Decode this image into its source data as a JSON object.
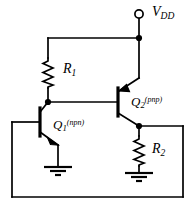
{
  "figure": {
    "type": "circuit-schematic",
    "title": "",
    "line_color": "#000000",
    "background_color": "#ffffff"
  },
  "labels": {
    "supply": {
      "symbol": "V",
      "subscript": "DD",
      "name": "supply-rail-label"
    },
    "r1": {
      "symbol": "R",
      "subscript": "1",
      "name": "resistor-r1-label"
    },
    "r2": {
      "symbol": "R",
      "subscript": "2",
      "name": "resistor-r2-label"
    },
    "q1": {
      "symbol": "Q",
      "subscript": "1",
      "superscript": "(npn)",
      "name": "transistor-q1-label"
    },
    "q2": {
      "symbol": "Q",
      "subscript": "2",
      "superscript": "(pnp)",
      "name": "transistor-q2-label"
    }
  },
  "components": {
    "terminal_vdd": {
      "kind": "open-terminal",
      "label": "V_DD"
    },
    "r1": {
      "kind": "resistor",
      "label": "R1"
    },
    "r2": {
      "kind": "resistor",
      "label": "R2"
    },
    "q1": {
      "kind": "bjt-npn",
      "label": "Q1"
    },
    "q2": {
      "kind": "bjt-pnp",
      "label": "Q2"
    },
    "ground_left": {
      "kind": "ground",
      "label": ""
    },
    "ground_right": {
      "kind": "ground",
      "label": ""
    }
  }
}
